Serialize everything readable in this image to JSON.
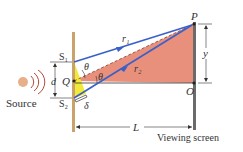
{
  "diagram": {
    "labels": {
      "source": "Source",
      "s1": "S₁",
      "s2": "S₂",
      "d": "d",
      "q": "Q",
      "theta_upper": "θ",
      "theta_lower": "θ",
      "delta": "δ",
      "r1": "r₁",
      "r2": "r₂",
      "p": "P",
      "o": "O",
      "y": "y",
      "l": "L",
      "viewing_screen": "Viewing screen"
    },
    "colors": {
      "barrier": "#c9a36b",
      "screen": "#6b6b6b",
      "ray": "#3a5fc8",
      "triangle_red": "#e8907c",
      "triangle_yellow": "#f2ea3a",
      "wave": "#b24a3a",
      "source_ball": "#e8b08a"
    }
  }
}
